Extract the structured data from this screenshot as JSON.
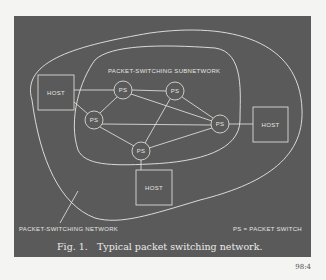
{
  "figure": {
    "caption_number": "Fig. 1.",
    "caption_text": "Typical packet switching network.",
    "page_number": "98:4",
    "colors": {
      "panel": "#5a5a5a",
      "line": "#e8e8e4",
      "page": "#f4f4f2"
    }
  },
  "labels": {
    "subnetwork": "PACKET-SWITCHING SUBNETWORK",
    "network": "PACKET-SWITCHING NETWORK",
    "legend": "PS = PACKET SWITCH"
  },
  "nodes": {
    "ps": [
      "PS",
      "PS",
      "PS",
      "PS",
      "PS"
    ],
    "hosts": [
      "HOST",
      "HOST",
      "HOST"
    ]
  }
}
